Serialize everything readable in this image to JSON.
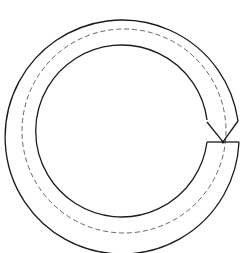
{
  "diagram": {
    "stroke_color": "#1a1a1a",
    "dashed_color": "#555555",
    "background": "#ffffff",
    "center": [
      124,
      131
    ],
    "radii": {
      "outer": 117,
      "centerline": 102,
      "inner": 86
    },
    "gap_point": [
      223,
      142
    ]
  }
}
